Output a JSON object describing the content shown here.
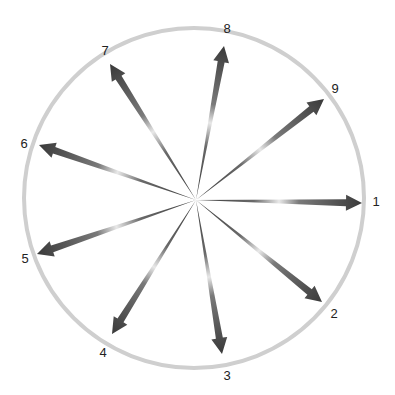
{
  "diagram": {
    "type": "radial-arrows",
    "center": [
      196,
      200
    ],
    "circle": {
      "cx": 194,
      "cy": 198,
      "r": 170,
      "stroke": "#cfcfcf"
    },
    "arrow_color_dark": "#3a3a3a",
    "arrow_color_light": "#e8e8e8",
    "arrows": [
      {
        "label": "1",
        "tip": [
          362,
          203
        ],
        "label_pos": [
          376,
          201
        ]
      },
      {
        "label": "2",
        "tip": [
          322,
          302
        ],
        "label_pos": [
          334,
          313
        ]
      },
      {
        "label": "3",
        "tip": [
          222,
          354
        ],
        "label_pos": [
          227,
          375
        ]
      },
      {
        "label": "4",
        "tip": [
          112,
          334
        ],
        "label_pos": [
          103,
          352
        ]
      },
      {
        "label": "5",
        "tip": [
          37,
          254
        ],
        "label_pos": [
          25,
          258
        ]
      },
      {
        "label": "6",
        "tip": [
          39,
          145
        ],
        "label_pos": [
          24,
          143
        ]
      },
      {
        "label": "7",
        "tip": [
          110,
          64
        ],
        "label_pos": [
          105,
          50
        ]
      },
      {
        "label": "8",
        "tip": [
          224,
          46
        ],
        "label_pos": [
          227,
          28
        ]
      },
      {
        "label": "9",
        "tip": [
          324,
          99
        ],
        "label_pos": [
          335,
          88
        ]
      }
    ]
  }
}
